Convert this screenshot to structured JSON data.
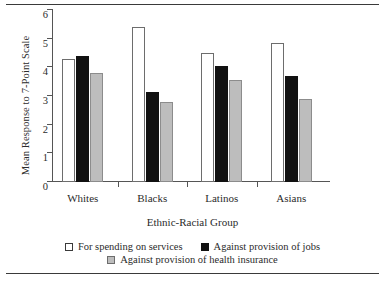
{
  "figure": {
    "rule_top": "horizontal-rule",
    "rule_bottom": "horizontal-rule"
  },
  "chart_data": {
    "type": "bar",
    "title": "",
    "xlabel": "Ethnic-Racial Group",
    "ylabel": "Mean Response to 7-Point Scale",
    "categories": [
      "Whites",
      "Blacks",
      "Latinos",
      "Asians"
    ],
    "series": [
      {
        "name": "For spending on services",
        "color": "#ffffff",
        "values": [
          4.3,
          5.4,
          4.5,
          4.85
        ]
      },
      {
        "name": "Against provision of jobs",
        "color": "#111111",
        "values": [
          4.4,
          3.15,
          4.05,
          3.7
        ]
      },
      {
        "name": "Against provision of health insurance",
        "color": "#bdbdbd",
        "values": [
          3.8,
          2.8,
          3.55,
          2.9
        ]
      }
    ],
    "ylim": [
      0,
      6
    ],
    "yticks": [
      0,
      1,
      2,
      3,
      4,
      5,
      6
    ],
    "ytick_labels": [
      "0",
      "1",
      "2",
      "3",
      "4",
      "5",
      "6"
    ],
    "grid": false,
    "legend_position": "bottom"
  }
}
